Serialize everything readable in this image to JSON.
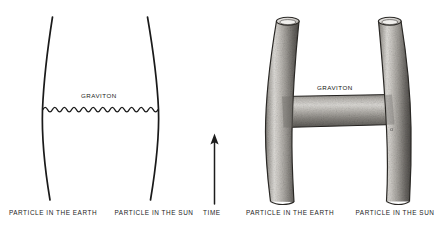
{
  "figure": {
    "background_color": "#ffffff",
    "ink_color": "#1a1a1a",
    "tube_light": "#d8d6d2",
    "tube_mid": "#9a9792",
    "tube_dark": "#4f4d4a",
    "panels": [
      {
        "id": "feynman-diagram",
        "name": "point-particle-feynman-diagram",
        "graviton_label": "GRAVITON",
        "left_worldline_label": "PARTICLE IN THE EARTH",
        "right_worldline_label": "PARTICLE IN THE SUN"
      },
      {
        "id": "string-worldsheet-diagram",
        "name": "string-worldsheet-tube-diagram",
        "graviton_label": "GRAVITON",
        "left_worldline_label": "PARTICLE IN THE EARTH",
        "right_worldline_label": "PARTICLE IN THE SUN",
        "faint_mark": "o"
      }
    ],
    "time_axis": {
      "label": "TIME",
      "direction": "up",
      "arrow_glyph": "arrow-up-icon"
    }
  }
}
